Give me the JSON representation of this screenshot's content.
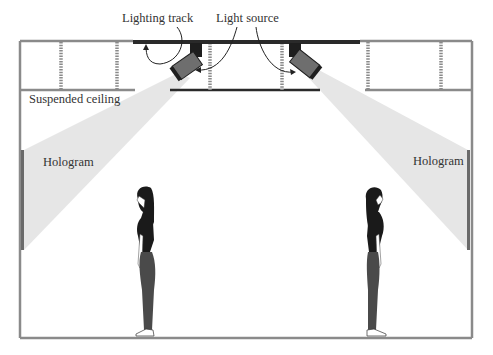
{
  "diagram": {
    "labels": {
      "lighting_track": "Lighting track",
      "light_source": "Light source",
      "suspended_ceiling": "Suspended ceiling",
      "hologram_left": "Hologram",
      "hologram_right": "Hologram"
    },
    "colors": {
      "wall": "#8a8a8a",
      "track": "#2a2a2a",
      "beam": "#e6e6e6",
      "projector_body": "#6e6e6e",
      "projector_mount": "#1e1e1e",
      "figure_top": "#1a1a1a",
      "figure_legs": "#4a4a4a"
    },
    "elements": [
      "room-outline",
      "suspended-ceiling",
      "lighting-track",
      "light-source-left",
      "light-source-right",
      "light-beam-left",
      "light-beam-right",
      "hologram-screen-left",
      "hologram-screen-right",
      "person-left",
      "person-right"
    ]
  }
}
